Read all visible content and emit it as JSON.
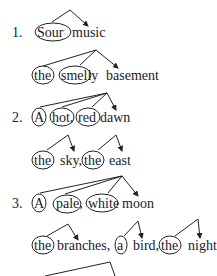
{
  "items": [
    {
      "number": "1.",
      "lines": [
        {
          "words": [
            "Sour",
            "music"
          ],
          "circled": [
            0
          ]
        },
        {
          "words": [
            "the",
            "smelly",
            "basement"
          ],
          "circled": [
            0,
            1
          ]
        }
      ]
    },
    {
      "number": "2.",
      "lines": [
        {
          "words": [
            "A",
            "hot,",
            "red",
            "dawn"
          ],
          "circled": [
            0,
            1,
            2
          ]
        },
        {
          "words": [
            "the",
            "sky,",
            "the",
            "east"
          ],
          "circled": [
            0,
            2
          ]
        }
      ]
    },
    {
      "number": "3.",
      "lines": [
        {
          "words": [
            "A",
            "pale,",
            "white",
            "moon"
          ],
          "circled": [
            0,
            1,
            2
          ]
        },
        {
          "words": [
            "the",
            "branches,",
            "a",
            "bird,",
            "the",
            "night"
          ],
          "circled": [
            0,
            2,
            4
          ]
        }
      ]
    }
  ],
  "labels": {
    "n1": "1.",
    "l1a_w0": "Sour",
    "l1a_w1": "music",
    "l1b_w0": "the",
    "l1b_w1": "smelly",
    "l1b_w2": "basement",
    "n2": "2.",
    "l2a_w0": "A",
    "l2a_w1": "hot,",
    "l2a_w2": "red",
    "l2a_w3": "dawn",
    "l2b_w0": "the",
    "l2b_w1": "sky,",
    "l2b_w2": "the",
    "l2b_w3": "east",
    "n3": "3.",
    "l3a_w0": "A",
    "l3a_w1": "pale,",
    "l3a_w2": "white",
    "l3a_w3": "moon",
    "l3b_w0": "the",
    "l3b_w1": "branches,",
    "l3b_w2": "a",
    "l3b_w3": "bird,",
    "l3b_w4": "the",
    "l3b_w5": "night"
  }
}
